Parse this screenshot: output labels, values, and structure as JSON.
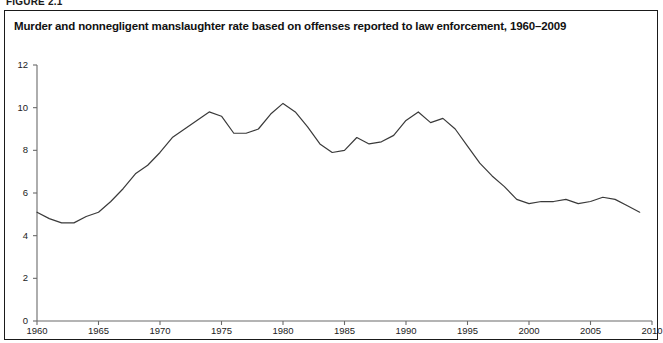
{
  "figure_label": "FIGURE 2.1",
  "title": "Murder and nonnegligent manslaughter rate based on offenses reported to law enforcement, 1960–2009",
  "axes": {
    "y_ticks": [
      "0",
      "2",
      "4",
      "6",
      "8",
      "10",
      "12"
    ],
    "x_ticks": [
      "1960",
      "1965",
      "1970",
      "1975",
      "1980",
      "1985",
      "1990",
      "1995",
      "2000",
      "2005",
      "2010"
    ]
  },
  "colors": {
    "line": "#3a3a3a",
    "axis": "#6b6b6b",
    "frame": "#1a1a1a",
    "text": "#111111",
    "background": "#ffffff"
  },
  "chart_data": {
    "type": "line",
    "title": "Murder and nonnegligent manslaughter rate based on offenses reported to law enforcement, 1960–2009",
    "xlabel": "",
    "ylabel": "",
    "xlim": [
      1960,
      2010
    ],
    "ylim": [
      0,
      12
    ],
    "yticks": [
      0,
      2,
      4,
      6,
      8,
      10,
      12
    ],
    "xticks": [
      1960,
      1965,
      1970,
      1975,
      1980,
      1985,
      1990,
      1995,
      2000,
      2005,
      2010
    ],
    "grid": false,
    "legend": "none",
    "x": [
      1960,
      1961,
      1962,
      1963,
      1964,
      1965,
      1966,
      1967,
      1968,
      1969,
      1970,
      1971,
      1972,
      1973,
      1974,
      1975,
      1976,
      1977,
      1978,
      1979,
      1980,
      1981,
      1982,
      1983,
      1984,
      1985,
      1986,
      1987,
      1988,
      1989,
      1990,
      1991,
      1992,
      1993,
      1994,
      1995,
      1996,
      1997,
      1998,
      1999,
      2000,
      2001,
      2002,
      2003,
      2004,
      2005,
      2006,
      2007,
      2008,
      2009
    ],
    "series": [
      {
        "name": "Murder and nonnegligent manslaughter rate",
        "values": [
          5.1,
          4.8,
          4.6,
          4.6,
          4.9,
          5.1,
          5.6,
          6.2,
          6.9,
          7.3,
          7.9,
          8.6,
          9.0,
          9.4,
          9.8,
          9.6,
          8.8,
          8.8,
          9.0,
          9.7,
          10.2,
          9.8,
          9.1,
          8.3,
          7.9,
          8.0,
          8.6,
          8.3,
          8.4,
          8.7,
          9.4,
          9.8,
          9.3,
          9.5,
          9.0,
          8.2,
          7.4,
          6.8,
          6.3,
          5.7,
          5.5,
          5.6,
          5.6,
          5.7,
          5.5,
          5.6,
          5.8,
          5.7,
          5.4,
          5.1
        ]
      }
    ]
  }
}
